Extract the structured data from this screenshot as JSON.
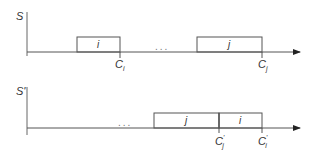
{
  "diagrams": [
    {
      "axis_label": "S",
      "dots": "...",
      "jobs": [
        {
          "name": "i",
          "completion_label": "C",
          "completion_sub": "i",
          "prime": ""
        },
        {
          "name": "j",
          "completion_label": "C",
          "completion_sub": "j",
          "prime": ""
        }
      ]
    },
    {
      "axis_label": "S'",
      "dots": "...",
      "jobs": [
        {
          "name": "j",
          "completion_label": "C",
          "completion_sub": "j",
          "prime": "'"
        },
        {
          "name": "i",
          "completion_label": "C",
          "completion_sub": "i",
          "prime": "'"
        }
      ]
    }
  ],
  "colors": {
    "line": "#555555",
    "text": "#333333"
  }
}
